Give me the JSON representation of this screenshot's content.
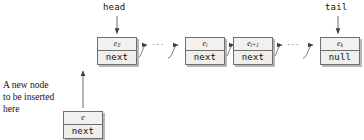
{
  "diagram": {
    "pointers": {
      "head_label": "head",
      "tail_label": "tail"
    },
    "caption": {
      "line1": "A new node",
      "line2": "to be inserted",
      "line3": "here"
    },
    "ellipsis": {
      "first": "···",
      "second": "···"
    },
    "nodes": [
      {
        "id": "node-e0",
        "value": "e",
        "subscript": "0",
        "link": "next"
      },
      {
        "id": "node-ei",
        "value": "e",
        "subscript": "i",
        "link": "next"
      },
      {
        "id": "node-ei1",
        "value": "e",
        "subscript": "i+1",
        "link": "next"
      },
      {
        "id": "node-ek",
        "value": "e",
        "subscript": "k",
        "link": "null"
      },
      {
        "id": "node-new",
        "value": "e",
        "subscript": "",
        "link": "next"
      }
    ],
    "colors": {
      "node_fill": "#f2f1ef",
      "node_border": "#6f6f6f",
      "node_shadow": "#b9b7b4",
      "wire": "#5a5a5a",
      "text": "#121212",
      "background": "#ffffff"
    }
  }
}
